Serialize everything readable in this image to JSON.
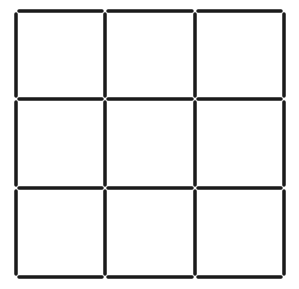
{
  "diagram": {
    "rows": 3,
    "cols": 3,
    "x_lines": [
      16,
      105,
      195,
      284
    ],
    "y_lines": [
      11,
      99,
      188,
      277
    ],
    "stick_color": "#1a1a1a",
    "stick_width": 3.5,
    "gap": 3,
    "background": "#ffffff",
    "stick_count": 24
  }
}
